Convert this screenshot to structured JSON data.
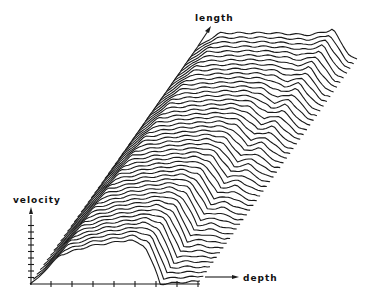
{
  "chart_data": {
    "type": "waterfall-3d",
    "title": "",
    "axes": {
      "x": {
        "label": "depth",
        "ticks": 8
      },
      "y": {
        "label": "velocity",
        "ticks": 9
      },
      "z": {
        "label": "length"
      }
    },
    "grid": false,
    "legend": null,
    "trace_count": 48,
    "front_profile": {
      "description": "velocity vs depth at nearest length position",
      "depth": [
        0,
        8,
        30,
        60,
        100,
        115,
        127,
        130,
        170
      ],
      "velocity": [
        0,
        6,
        29,
        38,
        44,
        38,
        10,
        0,
        3
      ]
    },
    "back_profile": {
      "description": "velocity vs depth at farthest length position",
      "depth": [
        0,
        7,
        30,
        80,
        120,
        138,
        143,
        150,
        160,
        167
      ],
      "velocity": [
        0,
        12,
        26,
        26,
        24,
        28,
        30,
        18,
        3,
        0
      ]
    },
    "trace_offset_px": {
      "dx": 160,
      "dy": -225
    },
    "origin_px": {
      "x": 30,
      "y": 284
    }
  },
  "labels": {
    "velocity": "velocity",
    "depth": "depth",
    "length": "length"
  },
  "colors": {
    "line": "#1a1a1a",
    "background": "#ffffff"
  }
}
